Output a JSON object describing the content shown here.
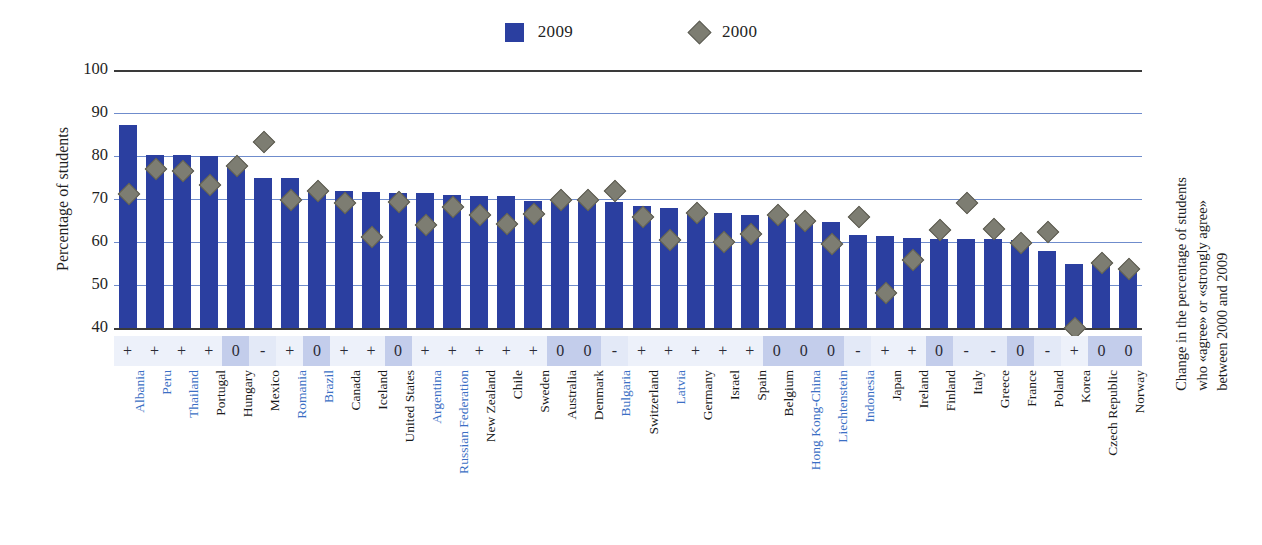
{
  "legend": {
    "items": [
      {
        "label": "2009",
        "marker": "square",
        "color": "#2B3FA0"
      },
      {
        "label": "2000",
        "marker": "diamond",
        "color": "#7d7d72"
      }
    ]
  },
  "axes": {
    "y_title": "Percentage of students",
    "y_ticks": [
      "100",
      "90",
      "80",
      "70",
      "60",
      "50",
      "40"
    ],
    "right_title_line1": "Change in the percentage of students",
    "right_title_line2": "who «agree» or «strongly  agree»",
    "right_title_line3": "between 2000 and 2009"
  },
  "chart_data": {
    "type": "bar",
    "title": "",
    "xlabel": "",
    "ylabel": "Percentage of students",
    "ylim": [
      40,
      100
    ],
    "yticks": [
      40,
      50,
      60,
      70,
      80,
      90,
      100
    ],
    "grid": true,
    "legend_position": "top-center",
    "categories": [
      "Albania",
      "Peru",
      "Thailand",
      "Portugal",
      "Hungary",
      "Mexico",
      "Romania",
      "Brazil",
      "Canada",
      "Iceland",
      "United States",
      "Argentina",
      "Russian Federation",
      "New Zealand",
      "Chile",
      "Sweden",
      "Australia",
      "Denmark",
      "Bulgaria",
      "Switzerland",
      "Latvia",
      "Germany",
      "Israel",
      "Spain",
      "Belgium",
      "Hong Kong-China",
      "Liechtenstein",
      "Indonesia",
      "Japan",
      "Ireland",
      "Finland",
      "Italy",
      "Greece",
      "France",
      "Poland",
      "Korea",
      "Czech Republic",
      "Norway"
    ],
    "category_types": [
      "partner",
      "partner",
      "partner",
      "oecd",
      "oecd",
      "oecd",
      "partner",
      "partner",
      "oecd",
      "oecd",
      "oecd",
      "partner",
      "partner",
      "oecd",
      "oecd",
      "oecd",
      "oecd",
      "oecd",
      "partner",
      "oecd",
      "partner",
      "oecd",
      "oecd",
      "oecd",
      "oecd",
      "partner",
      "partner",
      "partner",
      "oecd",
      "oecd",
      "oecd",
      "oecd",
      "oecd",
      "oecd",
      "oecd",
      "oecd",
      "oecd",
      "oecd"
    ],
    "series": [
      {
        "name": "2009",
        "marker": "bar",
        "color": "#2B3FA0",
        "values": [
          87.3,
          80.2,
          80.2,
          79.9,
          78.0,
          75.0,
          75.0,
          72.2,
          71.8,
          71.7,
          71.5,
          71.3,
          71.0,
          70.8,
          70.6,
          69.5,
          69.4,
          69.3,
          69.2,
          68.4,
          67.8,
          67.0,
          66.7,
          66.2,
          65.8,
          65.3,
          64.6,
          61.7,
          61.5,
          61.0,
          60.8,
          60.7,
          60.6,
          60.4,
          58.0,
          55.0,
          55.0,
          53.5
        ]
      },
      {
        "name": "2000",
        "marker": "diamond",
        "color": "#7d7d72",
        "values": [
          71.5,
          77.2,
          76.7,
          73.5,
          78.0,
          83.4,
          70.0,
          72.2,
          69.2,
          61.4,
          69.6,
          64.2,
          68.3,
          66.4,
          64.5,
          66.7,
          70.0,
          70.0,
          72.2,
          66.1,
          60.7,
          67.0,
          60.3,
          62.0,
          66.6,
          65.2,
          59.8,
          66.0,
          48.3,
          56.0,
          63.0,
          69.4,
          63.2,
          60.0,
          62.5,
          40.3,
          55.3,
          54.0
        ]
      }
    ],
    "change_symbols": [
      "+",
      "+",
      "+",
      "+",
      "0",
      "-",
      "+",
      "0",
      "+",
      "+",
      "0",
      "+",
      "+",
      "+",
      "+",
      "+",
      "0",
      "0",
      "-",
      "+",
      "+",
      "+",
      "+",
      "+",
      "0",
      "0",
      "0",
      "-",
      "+",
      "+",
      "0",
      "-",
      "-",
      "0",
      "-",
      "+",
      "0",
      "0"
    ]
  },
  "colors": {
    "bar_blue": "#2B3FA0",
    "diamond_gray": "#7d7d72",
    "gridline_blue": "#6f8ccc",
    "axis_dark": "#3a3a3a",
    "partner_label": "#3b6fc4",
    "cell_default_bg": "#edf1fa",
    "cell_zero_bg": "#c3cdeb"
  }
}
